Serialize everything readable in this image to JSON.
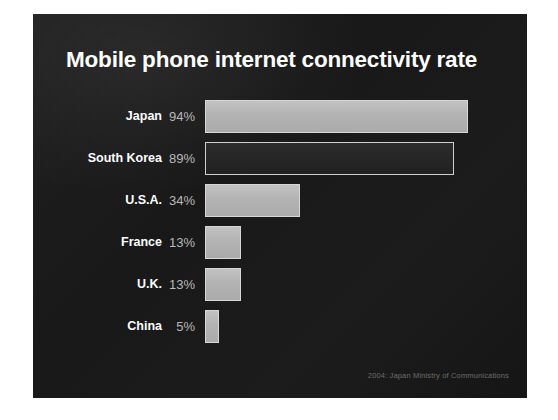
{
  "slide": {
    "title": "Mobile phone internet connectivity rate",
    "source_note": "2004: Japan Ministry of Communications",
    "background_color": "#151515",
    "title_color": "#ffffff",
    "label_color": "#ffffff",
    "value_color": "#b9b9b9",
    "bar_fill_color": "#b8b8b8",
    "bar_outline_color": "#d6d6d6",
    "source_color": "#6d6d6d"
  },
  "chart_data": {
    "type": "bar",
    "orientation": "horizontal",
    "title": "Mobile phone internet connectivity rate",
    "xlabel": "",
    "ylabel": "",
    "xlim": [
      0,
      100
    ],
    "grid": false,
    "legend": "none",
    "value_suffix": "%",
    "annotations": [
      "2004: Japan Ministry of Communications"
    ],
    "categories": [
      "Japan",
      "South Korea",
      "U.S.A.",
      "France",
      "U.K.",
      "China"
    ],
    "values": [
      94,
      89,
      34,
      13,
      13,
      5
    ],
    "value_labels": [
      "94%",
      "89%",
      "34%",
      "13%",
      "13%",
      "5%"
    ],
    "bar_styles": [
      "filled",
      "hollow",
      "filled",
      "filled",
      "filled",
      "filled"
    ],
    "bars": [
      {
        "category": "Japan",
        "value": 94,
        "label": "94%",
        "style": "filled"
      },
      {
        "category": "South Korea",
        "value": 89,
        "label": "89%",
        "style": "hollow"
      },
      {
        "category": "U.S.A.",
        "value": 34,
        "label": "34%",
        "style": "filled"
      },
      {
        "category": "France",
        "value": 13,
        "label": "13%",
        "style": "filled"
      },
      {
        "category": "U.K.",
        "value": 13,
        "label": "13%",
        "style": "filled"
      },
      {
        "category": "China",
        "value": 5,
        "label": "5%",
        "style": "filled"
      }
    ]
  }
}
